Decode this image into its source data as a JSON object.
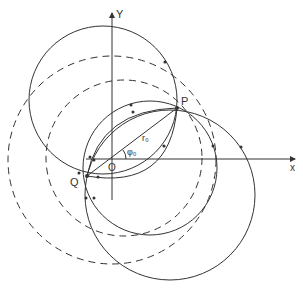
{
  "figure": {
    "axes": {
      "x_label": "x",
      "y_label": "Y"
    },
    "points": {
      "origin": "O",
      "p": "P",
      "q": "Q"
    },
    "annotations": {
      "radius": "r₀",
      "angle": "φ₀"
    },
    "colors": {
      "stroke": "#333333",
      "background": "#ffffff"
    }
  }
}
